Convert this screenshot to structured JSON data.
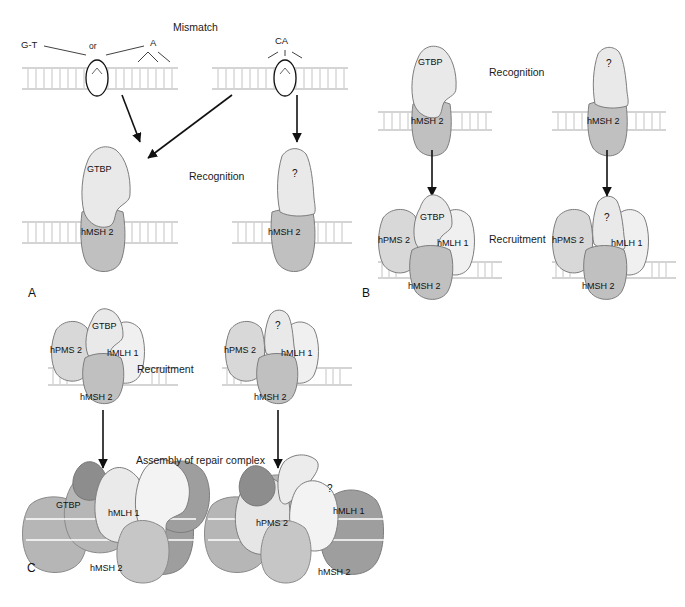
{
  "figure": {
    "panels": [
      {
        "id": "A",
        "letter": "A"
      },
      {
        "id": "B",
        "letter": "B"
      },
      {
        "id": "C",
        "letter": "C"
      }
    ],
    "process_labels": {
      "mismatch": "Mismatch",
      "recognition": "Recognition",
      "recruitment": "Recruitment",
      "assembly": "Assembly of repair complex"
    },
    "lesion_labels": {
      "base_mismatch_left": "G-T",
      "base_mismatch_or": "or",
      "base_mismatch_right": "A",
      "insertion_loop": "CA"
    },
    "proteins": {
      "gtbp": "GTBP",
      "hmsh2": "hMSH 2",
      "hmlh1": "hMLH 1",
      "hpms2": "hPMS 2",
      "unknown": "?"
    },
    "colors": {
      "gtbp_fill": "#e9e9e9",
      "hmsh2_fill": "#c0c0c0",
      "hmlh1_fill": "#f0f0f0",
      "hpms2_fill": "#d8d8d8",
      "complex_dark_fill": "#9e9e9e",
      "complex_mid_fill": "#b6b6b6",
      "outline": "#6f6f6f",
      "dna_line": "#a9a9a9",
      "arrow": "#111111",
      "text": "#1a1a1a",
      "background": "#ffffff"
    },
    "footer_note": ""
  },
  "panelA": {
    "letter": "A",
    "mismatch_heading": "Mismatch",
    "recognition_heading": "Recognition",
    "left_duplex": {
      "label_left": "G-T",
      "label_or": "or",
      "label_right": "A"
    },
    "right_duplex": {
      "label": "CA"
    },
    "left_complex": {
      "top": "GTBP",
      "bottom": "hMSH 2"
    },
    "right_complex": {
      "top": "?",
      "bottom": "hMSH 2"
    }
  },
  "panelB": {
    "letter": "B",
    "recognition_heading": "Recognition",
    "recruitment_heading": "Recruitment",
    "left_recognition": {
      "top": "GTBP",
      "bottom": "hMSH 2"
    },
    "right_recognition": {
      "top": "?",
      "bottom": "hMSH 2"
    },
    "left_recruitment": {
      "center": "GTBP",
      "left": "hPMS 2",
      "right": "hMLH 1",
      "bottom": "hMSH 2"
    },
    "right_recruitment": {
      "center": "?",
      "left": "hPMS 2",
      "right": "hMLH 1",
      "bottom": "hMSH 2"
    }
  },
  "panelC": {
    "letter": "C",
    "recruitment_heading": "Recruitment",
    "assembly_heading": "Assembly of repair complex",
    "left_recruitment": {
      "center": "GTBP",
      "left": "hPMS 2",
      "right": "hMLH 1",
      "bottom": "hMSH 2"
    },
    "right_recruitment": {
      "center": "?",
      "left": "hPMS 2",
      "right": "hMLH 1",
      "bottom": "hMSH 2"
    },
    "left_assembly": {
      "a": "GTBP",
      "b": "hMLH 1",
      "c": "hMSH 2"
    },
    "right_assembly": {
      "a": "hPMS 2",
      "b": "hMLH 1",
      "c": "hMSH 2",
      "d": "?"
    }
  }
}
